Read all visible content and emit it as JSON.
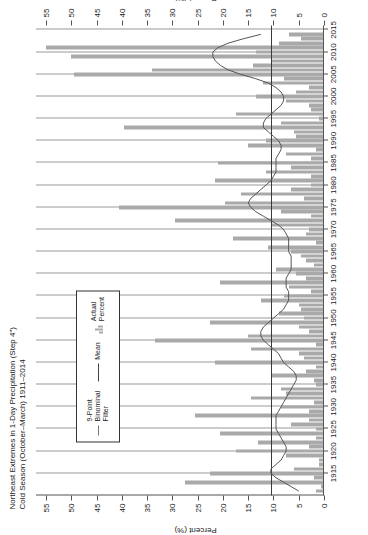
{
  "title": {
    "line1": "Northeast Extremes in 1-Day Precipitation (Step 4\")",
    "line2": "Cold Season (October–March) 1911–2014"
  },
  "legend": {
    "items": [
      {
        "name": "binomial-filter",
        "label": "9-Point\nBinominal\nFilter",
        "label_l1": "9-Point",
        "label_l2": "Binominal",
        "label_l3": "Filter",
        "swatch": "thin-line"
      },
      {
        "name": "mean",
        "label": "Mean",
        "swatch": "line"
      },
      {
        "name": "actual-percent",
        "label_l1": "Actual",
        "label_l2": "Percent",
        "swatch": "bars"
      }
    ]
  },
  "axes": {
    "y_label": "Percent (%)",
    "y_label_secondary": "Percent (%)",
    "y_ticks": [
      0,
      5,
      10,
      15,
      20,
      25,
      30,
      35,
      40,
      45,
      50,
      55
    ],
    "y_min": 0,
    "y_max": 57,
    "x_ticks": [
      1915,
      1920,
      1925,
      1930,
      1935,
      1940,
      1945,
      1950,
      1955,
      1960,
      1965,
      1970,
      1975,
      1980,
      1985,
      1990,
      1995,
      2000,
      2005,
      2010,
      2015
    ],
    "x_min": 1910,
    "x_max": 2016
  },
  "colors": {
    "bar": "#a9a9a9",
    "mean_line": "#3a3a3a",
    "filter_line": "#555555",
    "grid": "#9a9a9a",
    "axis": "#555555",
    "text": "#1a1a1a"
  },
  "chart_data": {
    "type": "bar",
    "title": "Northeast Extremes in 1-Day Precipitation (Step 4\") Cold Season (October–March) 1911–2014",
    "xlabel": "",
    "ylabel": "Percent (%)",
    "ylim": [
      0,
      57
    ],
    "xlim": [
      1910,
      2016
    ],
    "grid": true,
    "legend_position": "upper-left-inset",
    "mean_value": 10.5,
    "x": [
      1911,
      1912,
      1913,
      1914,
      1915,
      1916,
      1917,
      1918,
      1919,
      1920,
      1921,
      1922,
      1923,
      1924,
      1925,
      1926,
      1927,
      1928,
      1929,
      1930,
      1931,
      1932,
      1933,
      1934,
      1935,
      1936,
      1937,
      1938,
      1939,
      1940,
      1941,
      1942,
      1943,
      1944,
      1945,
      1946,
      1947,
      1948,
      1949,
      1950,
      1951,
      1952,
      1953,
      1954,
      1955,
      1956,
      1957,
      1958,
      1959,
      1960,
      1961,
      1962,
      1963,
      1964,
      1965,
      1966,
      1967,
      1968,
      1969,
      1970,
      1971,
      1972,
      1973,
      1974,
      1975,
      1976,
      1977,
      1978,
      1979,
      1980,
      1981,
      1982,
      1983,
      1984,
      1985,
      1986,
      1987,
      1988,
      1989,
      1990,
      1991,
      1992,
      1993,
      1994,
      1995,
      1996,
      1997,
      1998,
      1999,
      2000,
      2001,
      2002,
      2003,
      2004,
      2005,
      2006,
      2007,
      2008,
      2009,
      2010,
      2011,
      2012,
      2013,
      2014
    ],
    "series": [
      {
        "name": "Actual Percent",
        "type": "bar",
        "values": [
          1.5,
          0.5,
          27.5,
          2.0,
          22.5,
          6.0,
          1.0,
          1.0,
          7.5,
          17.5,
          3.0,
          13.0,
          1.5,
          20.5,
          1.5,
          6.5,
          3.0,
          25.5,
          3.0,
          8.5,
          2.0,
          14.5,
          7.5,
          8.5,
          1.5,
          2.0,
          10.5,
          3.5,
          1.5,
          21.5,
          4.0,
          5.0,
          14.5,
          1.5,
          33.5,
          15.0,
          3.0,
          5.0,
          22.5,
          4.0,
          9.0,
          4.5,
          5.0,
          12.5,
          8.0,
          2.5,
          7.0,
          20.5,
          3.5,
          5.5,
          9.5,
          2.0,
          3.5,
          4.5,
          6.5,
          11.0,
          1.5,
          18.0,
          3.5,
          3.0,
          10.5,
          29.5,
          2.5,
          8.5,
          40.5,
          19.5,
          4.0,
          16.5,
          6.5,
          2.5,
          21.5,
          2.5,
          11.5,
          6.5,
          21.0,
          2.5,
          7.5,
          1.5,
          15.0,
          11.5,
          5.5,
          6.0,
          39.5,
          8.5,
          1.0,
          17.5,
          2.5,
          3.0,
          7.5,
          13.5,
          5.5,
          3.0,
          12.0,
          8.0,
          49.5,
          34.0,
          14.0,
          10.5,
          50.0,
          13.5,
          55.0,
          9.0,
          4.5,
          7.0
        ]
      },
      {
        "name": "9-Point Binominal Filter",
        "type": "line",
        "values": [
          5.0,
          6.5,
          8.0,
          9.5,
          10.5,
          10.5,
          9.5,
          8.5,
          8.0,
          7.5,
          7.5,
          8.0,
          8.5,
          9.0,
          9.5,
          9.5,
          9.5,
          9.5,
          9.0,
          8.5,
          8.0,
          7.5,
          7.0,
          6.5,
          6.0,
          5.5,
          5.5,
          6.0,
          7.0,
          8.0,
          8.5,
          9.0,
          10.0,
          11.0,
          12.0,
          12.5,
          12.5,
          12.0,
          11.0,
          10.0,
          9.0,
          8.0,
          7.5,
          7.0,
          7.0,
          7.0,
          7.5,
          7.5,
          7.5,
          7.0,
          6.5,
          6.5,
          6.5,
          6.5,
          7.0,
          7.0,
          7.0,
          7.0,
          7.5,
          8.0,
          9.0,
          10.5,
          12.0,
          13.5,
          14.5,
          15.0,
          14.5,
          13.5,
          12.5,
          11.5,
          10.5,
          10.0,
          9.5,
          9.5,
          9.5,
          9.5,
          9.0,
          8.5,
          8.5,
          9.0,
          10.0,
          11.0,
          12.0,
          12.0,
          11.5,
          10.5,
          9.5,
          8.5,
          8.0,
          8.0,
          8.5,
          9.5,
          11.0,
          13.5,
          16.5,
          19.0,
          20.5,
          21.5,
          22.0,
          22.0,
          21.0,
          19.0,
          16.0,
          12.5
        ]
      },
      {
        "name": "Mean",
        "type": "hline",
        "value": 10.5
      }
    ]
  }
}
